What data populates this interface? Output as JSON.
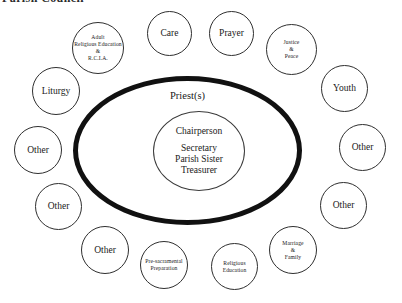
{
  "heading": {
    "text": "Parish Council"
  },
  "diagram": {
    "center": {
      "outer_label": "Priest(s)",
      "chairperson": "Chairperson",
      "officers": [
        "Secretary",
        "Parish Sister",
        "Treasurer"
      ]
    },
    "nodes": [
      {
        "name": "adult-religious-education",
        "label": "Adult\nReligious Education\n&\nR.C.I.A.",
        "size": "small",
        "x": 72,
        "y": 22,
        "d": 52
      },
      {
        "name": "care",
        "label": "Care",
        "size": "big",
        "x": 147,
        "y": 11,
        "d": 45
      },
      {
        "name": "prayer",
        "label": "Prayer",
        "size": "big",
        "x": 209,
        "y": 11,
        "d": 45
      },
      {
        "name": "justice-and-peace",
        "label": "Justice\n&\nPeace",
        "size": "small",
        "x": 266,
        "y": 24,
        "d": 51
      },
      {
        "name": "liturgy",
        "label": "Liturgy",
        "size": "big",
        "x": 32,
        "y": 67,
        "d": 48
      },
      {
        "name": "youth",
        "label": "Youth",
        "size": "big",
        "x": 321,
        "y": 65,
        "d": 47
      },
      {
        "name": "other-left-upper",
        "label": "Other",
        "size": "big",
        "x": 14,
        "y": 126,
        "d": 48
      },
      {
        "name": "other-right-upper",
        "label": "Other",
        "size": "big",
        "x": 339,
        "y": 124,
        "d": 47
      },
      {
        "name": "other-left-lower",
        "label": "Other",
        "size": "big",
        "x": 35,
        "y": 183,
        "d": 47
      },
      {
        "name": "other-right-lower",
        "label": "Other",
        "size": "big",
        "x": 320,
        "y": 182,
        "d": 47
      },
      {
        "name": "other-bottom-left",
        "label": "Other",
        "size": "big",
        "x": 81,
        "y": 226,
        "d": 48
      },
      {
        "name": "pre-sacramental-preparation",
        "label": "Pre-sacramental\nPreparation",
        "size": "small",
        "x": 140,
        "y": 241,
        "d": 48
      },
      {
        "name": "religious-education",
        "label": "Religious\nEducation",
        "size": "small",
        "x": 211,
        "y": 243,
        "d": 47
      },
      {
        "name": "marriage-and-family",
        "label": "Marriage\n&\nFamily",
        "size": "small",
        "x": 269,
        "y": 226,
        "d": 48
      }
    ]
  }
}
